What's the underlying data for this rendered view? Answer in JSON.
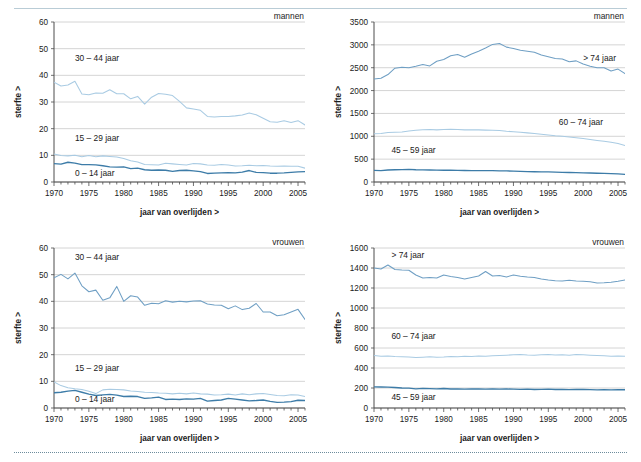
{
  "figure": {
    "xlabel": "jaar van overlijden >",
    "ylabel": "sterfte >",
    "colors": {
      "series_top": "#6f9fc4",
      "series_mid": "#a9cbe3",
      "series_bottom": "#3d7ca8",
      "gridline": "#c9c9c9",
      "axis": "#4d4d4d",
      "rule_top": "#b9ccd6",
      "rule_bottom": "#6d8c9c"
    }
  },
  "chart_data": [
    {
      "id": "mannen-jong",
      "type": "line",
      "title": "",
      "sex_label": "mannen",
      "xlabel": "jaar van overlijden >",
      "ylabel": "sterfte >",
      "xlim": [
        1970,
        2006
      ],
      "ylim": [
        0,
        60
      ],
      "yticks": [
        0,
        10,
        20,
        30,
        40,
        50,
        60
      ],
      "xticks": [
        1970,
        1975,
        1980,
        1985,
        1990,
        1995,
        2000,
        2005
      ],
      "grid": true,
      "legend_position": "inline-annotations",
      "annotations": [
        "30 – 44 jaar",
        "15 – 29 jaar",
        "0 – 14 jaar"
      ],
      "x": [
        1970,
        1971,
        1972,
        1973,
        1974,
        1975,
        1976,
        1977,
        1978,
        1979,
        1980,
        1981,
        1982,
        1983,
        1984,
        1985,
        1986,
        1987,
        1988,
        1989,
        1990,
        1991,
        1992,
        1993,
        1994,
        1995,
        1996,
        1997,
        1998,
        1999,
        2000,
        2001,
        2002,
        2003,
        2004,
        2005,
        2006
      ],
      "series": [
        {
          "name": "30 – 44 jaar",
          "color": "#a9cbe3",
          "values": [
            37.4,
            36.0,
            36.4,
            37.8,
            33.0,
            32.7,
            33.4,
            33.3,
            34.6,
            33.1,
            33.1,
            31.2,
            32.1,
            29.2,
            31.8,
            33.2,
            32.9,
            32.4,
            30.2,
            27.8,
            27.4,
            26.9,
            24.6,
            24.4,
            24.6,
            24.6,
            24.8,
            25.1,
            25.9,
            25.2,
            23.9,
            22.6,
            22.4,
            23.0,
            22.3,
            23.0,
            21.4
          ]
        },
        {
          "name": "15 – 29 jaar",
          "color": "#a9cbe3",
          "values": [
            10.5,
            9.9,
            9.8,
            10.0,
            9.5,
            9.9,
            9.5,
            9.8,
            9.6,
            9.4,
            8.8,
            8.0,
            7.5,
            6.6,
            6.5,
            6.4,
            7.0,
            6.8,
            6.6,
            6.4,
            6.9,
            6.8,
            6.4,
            6.3,
            6.6,
            6.4,
            6.0,
            6.1,
            6.3,
            6.1,
            6.2,
            6.0,
            5.9,
            6.0,
            5.9,
            5.9,
            5.2
          ]
        },
        {
          "name": "0 – 14 jaar",
          "color": "#3d7ca8",
          "values": [
            6.9,
            6.7,
            7.4,
            7.1,
            6.5,
            6.5,
            6.4,
            6.1,
            5.7,
            5.6,
            5.7,
            5.0,
            5.2,
            4.6,
            4.4,
            4.5,
            4.4,
            4.0,
            4.3,
            4.4,
            4.2,
            3.9,
            3.2,
            3.3,
            3.4,
            3.5,
            3.4,
            3.7,
            4.3,
            3.6,
            3.5,
            3.3,
            3.3,
            3.4,
            3.6,
            3.8,
            3.9
          ]
        }
      ]
    },
    {
      "id": "mannen-oud",
      "type": "line",
      "title": "",
      "sex_label": "mannen",
      "xlabel": "jaar van overlijden >",
      "ylabel": "sterfte >",
      "xlim": [
        1970,
        2006
      ],
      "ylim": [
        0,
        3500
      ],
      "yticks": [
        0,
        500,
        1000,
        1500,
        2000,
        2500,
        3000,
        3500
      ],
      "xticks": [
        1970,
        1975,
        1980,
        1985,
        1990,
        1995,
        2000,
        2005
      ],
      "grid": true,
      "legend_position": "inline-annotations",
      "annotations": [
        "> 74 jaar",
        "60 – 74 jaar",
        "45 – 59 jaar"
      ],
      "x": [
        1970,
        1971,
        1972,
        1973,
        1974,
        1975,
        1976,
        1977,
        1978,
        1979,
        1980,
        1981,
        1982,
        1983,
        1984,
        1985,
        1986,
        1987,
        1988,
        1989,
        1990,
        1991,
        1992,
        1993,
        1994,
        1995,
        1996,
        1997,
        1998,
        1999,
        2000,
        2001,
        2002,
        2003,
        2004,
        2005,
        2006
      ],
      "series": [
        {
          "name": "> 74 jaar",
          "color": "#6f9fc4",
          "values": [
            2255,
            2270,
            2350,
            2490,
            2510,
            2500,
            2530,
            2570,
            2540,
            2640,
            2680,
            2760,
            2790,
            2730,
            2800,
            2860,
            2930,
            3010,
            3030,
            2950,
            2920,
            2880,
            2860,
            2840,
            2780,
            2740,
            2700,
            2690,
            2630,
            2650,
            2580,
            2530,
            2500,
            2500,
            2430,
            2470,
            2370
          ]
        },
        {
          "name": "60 – 74 jaar",
          "color": "#a9cbe3",
          "values": [
            1055,
            1060,
            1085,
            1090,
            1095,
            1115,
            1130,
            1145,
            1150,
            1140,
            1150,
            1155,
            1150,
            1140,
            1145,
            1140,
            1135,
            1130,
            1125,
            1110,
            1100,
            1090,
            1075,
            1060,
            1045,
            1030,
            1010,
            1000,
            985,
            970,
            950,
            930,
            910,
            890,
            870,
            840,
            800
          ]
        },
        {
          "name": "45 – 59 jaar",
          "color": "#3d7ca8",
          "values": [
            255,
            250,
            262,
            268,
            272,
            275,
            268,
            265,
            262,
            260,
            258,
            258,
            255,
            252,
            250,
            248,
            250,
            248,
            245,
            242,
            238,
            232,
            228,
            225,
            222,
            220,
            215,
            212,
            208,
            205,
            200,
            196,
            192,
            188,
            182,
            176,
            168
          ]
        }
      ]
    },
    {
      "id": "vrouwen-jong",
      "type": "line",
      "title": "",
      "sex_label": "vrouwen",
      "xlabel": "jaar van overlijden >",
      "ylabel": "sterfte >",
      "xlim": [
        1970,
        2006
      ],
      "ylim": [
        0,
        60
      ],
      "yticks": [
        0,
        10,
        20,
        30,
        40,
        50,
        60
      ],
      "xticks": [
        1970,
        1975,
        1980,
        1985,
        1990,
        1995,
        2000,
        2005
      ],
      "grid": true,
      "legend_position": "inline-annotations",
      "annotations": [
        "30 – 44 jaar",
        "15 – 29 jaar",
        "0 – 14 jaar"
      ],
      "x": [
        1970,
        1971,
        1972,
        1973,
        1974,
        1975,
        1976,
        1977,
        1978,
        1979,
        1980,
        1981,
        1982,
        1983,
        1984,
        1985,
        1986,
        1987,
        1988,
        1989,
        1990,
        1991,
        1992,
        1993,
        1994,
        1995,
        1996,
        1997,
        1998,
        1999,
        2000,
        2001,
        2002,
        2003,
        2004,
        2005,
        2006
      ],
      "series": [
        {
          "name": "30 – 44 jaar",
          "color": "#6f9fc4",
          "values": [
            48.8,
            50.1,
            48.4,
            50.6,
            45.8,
            43.6,
            44.2,
            40.4,
            41.3,
            45.6,
            40.0,
            42.1,
            41.6,
            38.5,
            39.3,
            39.1,
            40.2,
            39.7,
            40.0,
            39.8,
            40.1,
            40.2,
            39.0,
            38.6,
            38.5,
            37.2,
            38.3,
            36.9,
            37.4,
            39.2,
            36.0,
            36.0,
            34.6,
            35.0,
            36.0,
            37.0,
            33.2
          ]
        },
        {
          "name": "15 – 29 jaar",
          "color": "#a9cbe3",
          "values": [
            9.8,
            8.4,
            7.6,
            7.2,
            6.9,
            6.3,
            5.4,
            6.8,
            7.0,
            6.9,
            6.8,
            6.4,
            6.2,
            5.9,
            5.8,
            5.6,
            5.5,
            5.3,
            5.5,
            5.3,
            5.6,
            5.3,
            5.2,
            4.9,
            5.0,
            5.2,
            4.9,
            5.3,
            5.0,
            5.3,
            5.4,
            5.1,
            4.7,
            4.6,
            5.0,
            4.9,
            4.3
          ]
        },
        {
          "name": "0 – 14 jaar",
          "color": "#3d7ca8",
          "values": [
            5.7,
            5.9,
            6.3,
            6.6,
            5.9,
            5.2,
            4.7,
            4.9,
            5.1,
            4.8,
            4.3,
            4.4,
            4.3,
            3.6,
            3.8,
            4.1,
            3.2,
            3.3,
            3.2,
            3.4,
            3.3,
            3.6,
            2.6,
            2.8,
            3.0,
            3.6,
            3.3,
            3.0,
            2.7,
            2.8,
            3.0,
            2.5,
            2.1,
            2.2,
            2.4,
            2.9,
            2.8
          ]
        }
      ]
    },
    {
      "id": "vrouwen-oud",
      "type": "line",
      "title": "",
      "sex_label": "vrouwen",
      "xlabel": "jaar van overlijden >",
      "ylabel": "sterfte >",
      "xlim": [
        1970,
        2006
      ],
      "ylim": [
        0,
        1600
      ],
      "yticks": [
        0,
        200,
        400,
        600,
        800,
        1000,
        1200,
        1400,
        1600
      ],
      "xticks": [
        1970,
        1975,
        1980,
        1985,
        1990,
        1995,
        2000,
        2005
      ],
      "grid": true,
      "legend_position": "inline-annotations",
      "annotations": [
        "> 74 jaar",
        "60 – 74 jaar",
        "45 – 59 jaar"
      ],
      "x": [
        1970,
        1971,
        1972,
        1973,
        1974,
        1975,
        1976,
        1977,
        1978,
        1979,
        1980,
        1981,
        1982,
        1983,
        1984,
        1985,
        1986,
        1987,
        1988,
        1989,
        1990,
        1991,
        1992,
        1993,
        1994,
        1995,
        1996,
        1997,
        1998,
        1999,
        2000,
        2001,
        2002,
        2003,
        2004,
        2005,
        2006
      ],
      "series": [
        {
          "name": "> 74 jaar",
          "color": "#6f9fc4",
          "values": [
            1400,
            1390,
            1430,
            1385,
            1380,
            1378,
            1330,
            1300,
            1305,
            1300,
            1330,
            1315,
            1305,
            1290,
            1305,
            1320,
            1365,
            1320,
            1325,
            1310,
            1330,
            1318,
            1310,
            1305,
            1290,
            1280,
            1272,
            1270,
            1278,
            1270,
            1268,
            1262,
            1250,
            1252,
            1258,
            1268,
            1280
          ]
        },
        {
          "name": "60 – 74 jaar",
          "color": "#a9cbe3",
          "values": [
            525,
            518,
            520,
            515,
            512,
            510,
            505,
            508,
            512,
            508,
            510,
            515,
            512,
            518,
            515,
            520,
            518,
            522,
            525,
            528,
            532,
            535,
            530,
            528,
            532,
            535,
            530,
            532,
            528,
            535,
            532,
            528,
            525,
            522,
            518,
            520,
            518
          ]
        },
        {
          "name": "45 – 59 jaar",
          "color": "#3d7ca8",
          "values": [
            212,
            210,
            208,
            205,
            200,
            198,
            192,
            196,
            194,
            192,
            195,
            190,
            192,
            188,
            190,
            192,
            188,
            190,
            188,
            190,
            188,
            186,
            188,
            185,
            186,
            188,
            185,
            186,
            184,
            186,
            185,
            184,
            182,
            183,
            182,
            184,
            182
          ]
        }
      ]
    }
  ]
}
